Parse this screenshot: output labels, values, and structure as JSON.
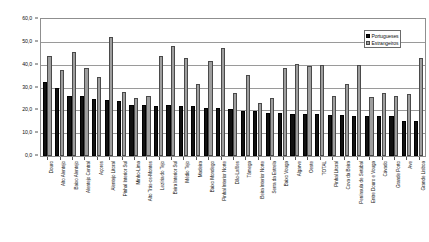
{
  "chart_data": {
    "type": "bar",
    "title": "",
    "subtitle": "",
    "xlabel": "",
    "ylabel": "",
    "ylim": [
      0.0,
      60.0
    ],
    "ytick_labels": [
      "0,0",
      "10,0",
      "20,0",
      "30,0",
      "40,0",
      "50,0",
      "60,0"
    ],
    "ytick_values": [
      0.0,
      10.0,
      20.0,
      30.0,
      40.0,
      50.0,
      60.0
    ],
    "grid": true,
    "legend_position": "top-right",
    "categories": [
      "Douro",
      "Alto Alentejo",
      "Baixo Alentejo",
      "Alentejo Central",
      "Açores",
      "Alentejo Litoral",
      "Pinhal Interior Sul",
      "Minho-Lima",
      "Alto Trás-os-Montes",
      "Lezíria do Tejo",
      "Beira Interior Sul",
      "Médio Tejo",
      "Madeira",
      "Baixo Mondego",
      "Pinhal Interior Norte",
      "Dão-Lafões",
      "Tâmega",
      "Beira Interior Norte",
      "Serra da Estrela",
      "Baixo Vouga",
      "Algarve",
      "Oeste",
      "TOTAL",
      "Pinhal Litoral",
      "Cova da Beira",
      "Península de Setúbal",
      "Entre Douro e Vouga",
      "Cávado",
      "Grande Porto",
      "Ave",
      "Grande Lisboa"
    ],
    "series": [
      {
        "name": "Portugueses",
        "color": "#111111",
        "values": [
          32.5,
          30.0,
          26.5,
          26.5,
          25.0,
          24.5,
          24.0,
          22.5,
          22.5,
          22.0,
          22.5,
          22.0,
          22.0,
          21.0,
          21.0,
          20.5,
          19.5,
          19.5,
          19.0,
          19.0,
          18.5,
          18.5,
          18.5,
          18.0,
          18.0,
          17.5,
          17.5,
          17.5,
          17.5,
          15.5,
          15.5
        ]
      },
      {
        "name": "Estrangeiros",
        "color": "#9e9e9e",
        "values": [
          44.0,
          37.5,
          45.5,
          38.5,
          34.5,
          52.0,
          28.0,
          25.5,
          26.5,
          44.0,
          48.0,
          43.0,
          31.5,
          41.5,
          47.5,
          27.5,
          35.5,
          23.0,
          25.5,
          38.5,
          40.5,
          39.5,
          40.0,
          26.5,
          31.5,
          40.0,
          26.0,
          27.5,
          26.5,
          27.0,
          43.0
        ]
      }
    ]
  },
  "legend": {
    "items": [
      {
        "label": "Portugueses",
        "swatch": "portugueses"
      },
      {
        "label": "Estrangeiros",
        "swatch": "estrangeiros"
      }
    ]
  }
}
